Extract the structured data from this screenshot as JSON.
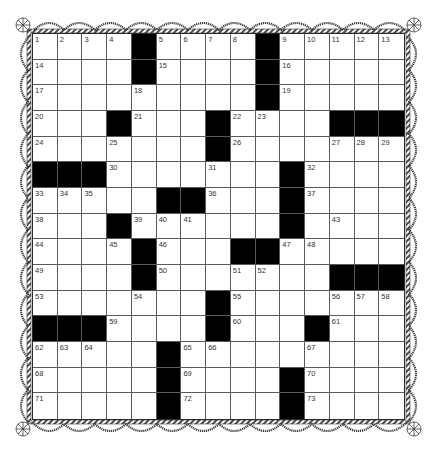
{
  "puzzle": {
    "rows": 15,
    "cols": 15,
    "colors": {
      "block": "#000000",
      "cell": "#ffffff",
      "gridline": "#5a5a5a",
      "number": "#333333",
      "border": "#3a3a3a"
    },
    "layout": [
      "....#....#.....",
      "....#....#.....",
      ".........#.....",
      "...#...#....###",
      ".......#.......",
      "###.......#....",
      ".....##...#....",
      "...#......#....",
      "....#...##.....",
      "....#.......###",
      ".......#.......",
      "###....#...#...",
      ".....#.........",
      ".....#....#....",
      ".....#....#...."
    ],
    "numbers": [
      {
        "r": 0,
        "c": 0,
        "n": "1"
      },
      {
        "r": 0,
        "c": 1,
        "n": "2"
      },
      {
        "r": 0,
        "c": 2,
        "n": "3"
      },
      {
        "r": 0,
        "c": 3,
        "n": "4"
      },
      {
        "r": 0,
        "c": 5,
        "n": "5"
      },
      {
        "r": 0,
        "c": 6,
        "n": "6"
      },
      {
        "r": 0,
        "c": 7,
        "n": "7"
      },
      {
        "r": 0,
        "c": 8,
        "n": "8"
      },
      {
        "r": 0,
        "c": 10,
        "n": "9"
      },
      {
        "r": 0,
        "c": 11,
        "n": "10"
      },
      {
        "r": 0,
        "c": 12,
        "n": "11"
      },
      {
        "r": 0,
        "c": 13,
        "n": "12"
      },
      {
        "r": 0,
        "c": 14,
        "n": "13"
      },
      {
        "r": 1,
        "c": 0,
        "n": "14"
      },
      {
        "r": 1,
        "c": 5,
        "n": "15"
      },
      {
        "r": 1,
        "c": 10,
        "n": "16"
      },
      {
        "r": 2,
        "c": 0,
        "n": "17"
      },
      {
        "r": 2,
        "c": 4,
        "n": "18"
      },
      {
        "r": 2,
        "c": 10,
        "n": "19"
      },
      {
        "r": 3,
        "c": 0,
        "n": "20"
      },
      {
        "r": 3,
        "c": 4,
        "n": "21"
      },
      {
        "r": 3,
        "c": 8,
        "n": "22"
      },
      {
        "r": 3,
        "c": 9,
        "n": "23"
      },
      {
        "r": 4,
        "c": 0,
        "n": "24"
      },
      {
        "r": 4,
        "c": 3,
        "n": "25"
      },
      {
        "r": 4,
        "c": 8,
        "n": "26"
      },
      {
        "r": 4,
        "c": 12,
        "n": "27"
      },
      {
        "r": 4,
        "c": 13,
        "n": "28"
      },
      {
        "r": 4,
        "c": 14,
        "n": "29"
      },
      {
        "r": 5,
        "c": 3,
        "n": "30"
      },
      {
        "r": 5,
        "c": 7,
        "n": "31"
      },
      {
        "r": 5,
        "c": 11,
        "n": "32"
      },
      {
        "r": 6,
        "c": 0,
        "n": "33"
      },
      {
        "r": 6,
        "c": 1,
        "n": "34"
      },
      {
        "r": 6,
        "c": 2,
        "n": "35"
      },
      {
        "r": 6,
        "c": 7,
        "n": "36"
      },
      {
        "r": 6,
        "c": 11,
        "n": "37"
      },
      {
        "r": 7,
        "c": 0,
        "n": "38"
      },
      {
        "r": 7,
        "c": 4,
        "n": "39"
      },
      {
        "r": 7,
        "c": 5,
        "n": "40"
      },
      {
        "r": 7,
        "c": 6,
        "n": "41"
      },
      {
        "r": 7,
        "c": 10,
        "n": "42"
      },
      {
        "r": 7,
        "c": 12,
        "n": "43"
      },
      {
        "r": 8,
        "c": 0,
        "n": "44"
      },
      {
        "r": 8,
        "c": 3,
        "n": "45"
      },
      {
        "r": 8,
        "c": 5,
        "n": "46"
      },
      {
        "r": 8,
        "c": 10,
        "n": "47"
      },
      {
        "r": 8,
        "c": 11,
        "n": "48"
      },
      {
        "r": 9,
        "c": 0,
        "n": "49"
      },
      {
        "r": 9,
        "c": 5,
        "n": "50"
      },
      {
        "r": 9,
        "c": 8,
        "n": "51"
      },
      {
        "r": 9,
        "c": 9,
        "n": "52"
      },
      {
        "r": 10,
        "c": 0,
        "n": "53"
      },
      {
        "r": 10,
        "c": 4,
        "n": "54"
      },
      {
        "r": 10,
        "c": 8,
        "n": "55"
      },
      {
        "r": 10,
        "c": 12,
        "n": "56"
      },
      {
        "r": 10,
        "c": 13,
        "n": "57"
      },
      {
        "r": 10,
        "c": 14,
        "n": "58"
      },
      {
        "r": 11,
        "c": 3,
        "n": "59"
      },
      {
        "r": 11,
        "c": 8,
        "n": "60"
      },
      {
        "r": 11,
        "c": 12,
        "n": "61"
      },
      {
        "r": 12,
        "c": 0,
        "n": "62"
      },
      {
        "r": 12,
        "c": 1,
        "n": "63"
      },
      {
        "r": 12,
        "c": 2,
        "n": "64"
      },
      {
        "r": 12,
        "c": 6,
        "n": "65"
      },
      {
        "r": 12,
        "c": 7,
        "n": "66"
      },
      {
        "r": 12,
        "c": 11,
        "n": "67"
      },
      {
        "r": 13,
        "c": 0,
        "n": "68"
      },
      {
        "r": 13,
        "c": 6,
        "n": "69"
      },
      {
        "r": 13,
        "c": 11,
        "n": "70"
      },
      {
        "r": 14,
        "c": 0,
        "n": "71"
      },
      {
        "r": 14,
        "c": 6,
        "n": "72"
      },
      {
        "r": 14,
        "c": 11,
        "n": "73"
      }
    ]
  }
}
